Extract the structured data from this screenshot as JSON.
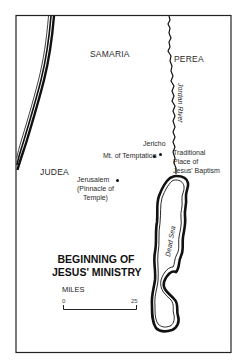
{
  "map": {
    "title_line1": "BEGINNING OF",
    "title_line2": "JESUS' MINISTRY",
    "regions": {
      "samaria": "SAMARIA",
      "perea": "PEREA",
      "judea": "JUDEA"
    },
    "water": {
      "jordan_river": "Jordan River",
      "dead_sea": "Dead Sea"
    },
    "places": {
      "jericho": "Jericho",
      "mt_temptation": "Mt. of Temptation",
      "baptism_line1": "Traditional",
      "baptism_line2": "Place of",
      "baptism_line3": "Jesus' Baptism",
      "jerusalem_line1": "Jerusalem",
      "jerusalem_line2": "(Pinnacle of",
      "jerusalem_line3": "Temple)"
    },
    "scale": {
      "unit_label": "MILES",
      "start": "0",
      "end": "25"
    },
    "colors": {
      "ink": "#111111",
      "background": "#ffffff"
    }
  }
}
